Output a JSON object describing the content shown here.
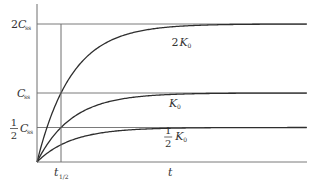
{
  "chart_data": {
    "type": "line",
    "title": "",
    "xlabel": "t",
    "ylabel": "",
    "x_ticks": [
      {
        "value": 1,
        "label": "t",
        "sub": "1/2"
      }
    ],
    "y_ticks": [
      {
        "value": 0.5,
        "label_num": "1",
        "label_den": "2",
        "label_main": "C",
        "label_sub": "ss"
      },
      {
        "value": 1.0,
        "label_main": "C",
        "label_sub": "ss"
      },
      {
        "value": 2.0,
        "label_coef": "2",
        "label_main": "C",
        "label_sub": "ss"
      }
    ],
    "xlim": [
      0,
      11.5
    ],
    "ylim": [
      0,
      2.55
    ],
    "grid": "horizontal-at-ticks",
    "series": [
      {
        "name": "2K0",
        "label_coef": "2",
        "label_main": "K",
        "label_sub": "0",
        "plateau": 2.0,
        "half_life": 1,
        "label_x": 5.6
      },
      {
        "name": "K0",
        "label_main": "K",
        "label_sub": "0",
        "plateau": 1.0,
        "half_life": 1,
        "label_x": 5.5
      },
      {
        "name": "1/2 K0",
        "label_num": "1",
        "label_den": "2",
        "label_main": "K",
        "label_sub": "0",
        "plateau": 0.5,
        "half_life": 1,
        "label_x": 5.3
      }
    ],
    "vertical_marker": {
      "x": 1,
      "label": "t1/2"
    }
  }
}
